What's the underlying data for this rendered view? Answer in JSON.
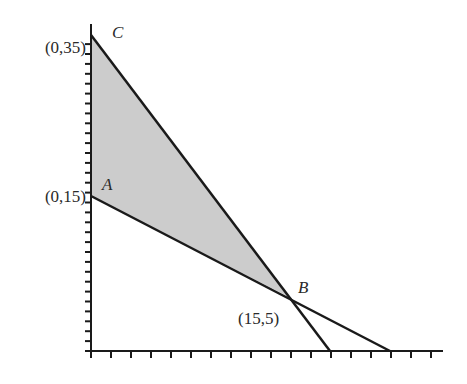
{
  "diagram": {
    "type": "feasible-region",
    "fill_color": "#cccccc",
    "line_color": "#1a1a1a",
    "points": {
      "A": {
        "label": "A",
        "coord_label": "(0,15)",
        "x": 0,
        "y": 15
      },
      "B": {
        "label": "B",
        "coord_label": "(15,5)",
        "x": 15,
        "y": 5
      },
      "C": {
        "label": "C",
        "coord_label": "(0,35)",
        "x": 0,
        "y": 35
      }
    },
    "lines": [
      {
        "name": "line-C-B",
        "from": "C",
        "through": "B",
        "x_intercept": 17.5
      },
      {
        "name": "line-A-B",
        "from": "A",
        "through": "B",
        "x_intercept": 22.5
      }
    ],
    "shaded_region": [
      "A",
      "B",
      "C"
    ],
    "axes": {
      "x_tick_count": 18,
      "y_tick_count": 32
    }
  }
}
